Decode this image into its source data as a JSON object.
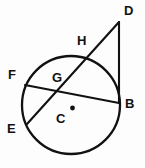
{
  "diagram": {
    "canvas": {
      "width": 145,
      "height": 168
    },
    "colors": {
      "background": "#fdfdfd",
      "stroke": "#111111",
      "label": "#111111"
    },
    "circle": {
      "name": "main-circle",
      "center_x": 71,
      "center_y": 105,
      "radius": 49
    },
    "center_marker": {
      "name": "center-point-dot",
      "x": 72.5,
      "y": 108,
      "radius": 2.4
    },
    "points": [
      {
        "id": "D",
        "label": "D",
        "x": 119,
        "y": 22,
        "label_x": 124,
        "label_y": 4,
        "on_circle": false
      },
      {
        "id": "H",
        "label": "H",
        "x": 88,
        "y": 57,
        "label_x": 77,
        "label_y": 34,
        "on_circle": true
      },
      {
        "id": "B",
        "label": "B",
        "x": 119,
        "y": 103,
        "label_x": 125,
        "label_y": 97,
        "on_circle": true
      },
      {
        "id": "F",
        "label": "F",
        "x": 25,
        "y": 85,
        "label_x": 8,
        "label_y": 68,
        "on_circle": true
      },
      {
        "id": "G",
        "label": "G",
        "x": 58,
        "y": 88,
        "label_x": 52,
        "label_y": 71,
        "on_circle": false
      },
      {
        "id": "E",
        "label": "E",
        "x": 27,
        "y": 124,
        "label_x": 7,
        "label_y": 122,
        "on_circle": true
      },
      {
        "id": "C",
        "label": "C",
        "x": 72,
        "y": 108,
        "label_x": 56,
        "label_y": 112,
        "on_circle": false
      }
    ],
    "segments": [
      {
        "name": "tangent-segment-DB",
        "from": "D",
        "to": "B",
        "x1": 119,
        "y1": 22,
        "x2": 119,
        "y2": 103
      },
      {
        "name": "secant-segment-DE",
        "from": "D",
        "to": "E",
        "x1": 119,
        "y1": 22,
        "x2": 27,
        "y2": 124
      },
      {
        "name": "chord-segment-FB",
        "from": "F",
        "to": "B",
        "x1": 25,
        "y1": 85,
        "x2": 119,
        "y2": 103
      }
    ]
  }
}
